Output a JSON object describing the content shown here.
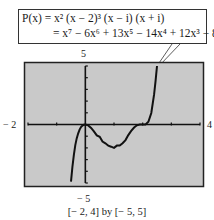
{
  "equation": {
    "line1": "P(x) = x² (x − 2)³ (x − i) (x + i)",
    "line2": "= x⁷ − 6x⁶ + 13x⁵ − 14x⁴ + 12x³ − 8x²"
  },
  "labels": {
    "ymax": "5",
    "ymin": "− 5",
    "xmin": "− 2",
    "xmax": "4"
  },
  "caption": "[− 2, 4] by [− 5, 5]",
  "colors": {
    "screen": "#c9c9c9",
    "curve": "#111111",
    "axis": "#111111",
    "frame": "#222222"
  },
  "chart_data": {
    "type": "line",
    "xlabel": "",
    "ylabel": "",
    "xlim": [
      -2,
      4
    ],
    "ylim": [
      -5,
      5
    ],
    "xscale": 1,
    "yscale": 1,
    "grid": false,
    "window_caption": "[−2, 4] by [−5, 5]",
    "series": [
      {
        "name": "P(x)",
        "x": [
          -0.5,
          -0.45,
          -0.4,
          -0.35,
          -0.3,
          -0.25,
          -0.2,
          -0.15,
          -0.1,
          -0.05,
          0,
          0.1,
          0.2,
          0.3,
          0.4,
          0.5,
          0.6,
          0.7,
          0.8,
          0.9,
          1.0,
          1.1,
          1.2,
          1.3,
          1.4,
          1.5,
          1.6,
          1.7,
          1.8,
          1.9,
          2.0,
          2.1,
          2.2,
          2.3,
          2.4,
          2.45,
          2.5
        ],
        "y": [
          -4.88,
          -3.63,
          -2.57,
          -1.76,
          -1.19,
          -0.75,
          -0.44,
          -0.22,
          -0.09,
          -0.02,
          0,
          -0.08,
          -0.29,
          -0.58,
          -0.93,
          -1.05,
          -1.46,
          -1.61,
          -1.81,
          -1.9,
          -2.0,
          -1.8,
          -1.8,
          -1.6,
          -1.33,
          -0.91,
          -0.55,
          -0.26,
          -0.07,
          -0.01,
          0,
          0.01,
          0.23,
          0.98,
          2.57,
          3.74,
          5.0
        ]
      }
    ],
    "roots": [
      0,
      2
    ]
  }
}
